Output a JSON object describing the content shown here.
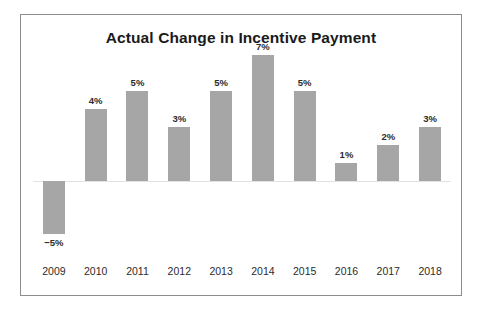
{
  "chart_data": {
    "type": "bar",
    "title": "Actual Change in Incentive Payment",
    "xlabel": "",
    "ylabel": "",
    "categories": [
      "2009",
      "2010",
      "2011",
      "2012",
      "2013",
      "2014",
      "2015",
      "2016",
      "2017",
      "2018"
    ],
    "values": [
      -5,
      4,
      5,
      3,
      5,
      7,
      5,
      1,
      2,
      3
    ],
    "data_labels": [
      "−5%",
      "4%",
      "5%",
      "3%",
      "5%",
      "7%",
      "5%",
      "1%",
      "2%",
      "3%"
    ],
    "ylim": [
      -5,
      7
    ],
    "grid": false,
    "legend": null,
    "zero_line": true,
    "bar_color": "#a6a6a6",
    "zero_line_color": "#e2e2e2",
    "border_color": "#8c8c8c",
    "text_color": "#2b2b2b",
    "title_color": "#1a1a1a",
    "background": "#ffffff"
  }
}
